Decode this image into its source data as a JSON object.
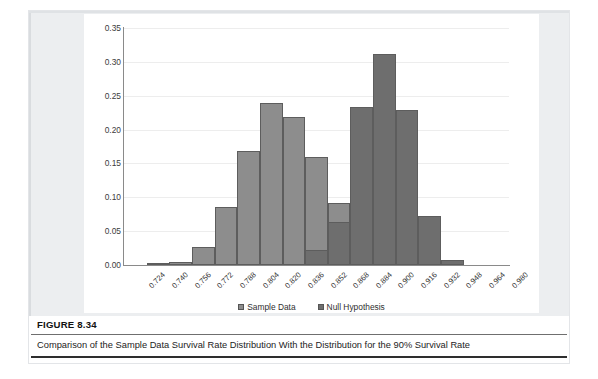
{
  "figure": {
    "number_label": "FIGURE 8.34",
    "caption": "Comparison of the Sample Data Survival Rate Distribution With the Distribution for the 90% Survival Rate"
  },
  "colors": {
    "sample_data": "#8d8d8d",
    "null_hypothesis": "#6e6e6e",
    "frame": "#eceef0",
    "panel": "#ffffff",
    "gridline": "#ededed",
    "axis": "#8a8a8a"
  },
  "chart_data": {
    "type": "bar",
    "title": "",
    "subtitle": "",
    "xlabel": "",
    "ylabel": "",
    "ylim": [
      0.0,
      0.35
    ],
    "ytick_labels": [
      "0.00",
      "0.05",
      "0.10",
      "0.15",
      "0.20",
      "0.25",
      "0.30",
      "0.35"
    ],
    "ytick_values": [
      0.0,
      0.05,
      0.1,
      0.15,
      0.2,
      0.25,
      0.3,
      0.35
    ],
    "grid": true,
    "grid_axis": "y",
    "legend_position": "bottom",
    "overlap": "overlaid",
    "categories": [
      "0.724",
      "0.740",
      "0.756",
      "0.772",
      "0.788",
      "0.804",
      "0.820",
      "0.836",
      "0.852",
      "0.868",
      "0.884",
      "0.900",
      "0.916",
      "0.932",
      "0.948",
      "0.964",
      "0.980"
    ],
    "series": [
      {
        "name": "Sample Data",
        "color": "#8d8d8d",
        "values": [
          0.0,
          0.002,
          0.005,
          0.027,
          0.085,
          0.169,
          0.24,
          0.218,
          0.159,
          0.092,
          0.0,
          0.0,
          0.0,
          0.0,
          0.0,
          0.0,
          0.0
        ]
      },
      {
        "name": "Null Hypothesis",
        "color": "#6e6e6e",
        "values": [
          0.0,
          0.0,
          0.0,
          0.0,
          0.0,
          0.0,
          0.0,
          0.0,
          0.022,
          0.063,
          0.234,
          0.311,
          0.229,
          0.072,
          0.007,
          0.0,
          0.0
        ]
      }
    ]
  },
  "legend": {
    "items": [
      {
        "label": "Sample Data"
      },
      {
        "label": "Null Hypothesis"
      }
    ]
  }
}
